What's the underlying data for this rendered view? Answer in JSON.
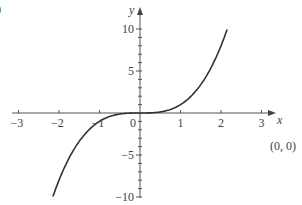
{
  "part_label": ")",
  "annotation": "(0, 0)",
  "chart_data": {
    "type": "line",
    "title": "",
    "function": "y = x^3",
    "xlabel": "x",
    "ylabel": "y",
    "xlim": [
      -3,
      3
    ],
    "ylim": [
      -10,
      10
    ],
    "x_ticks": [
      "-3",
      "-2",
      "-1",
      "0",
      "1",
      "2",
      "3"
    ],
    "y_ticks": [
      "10",
      "5",
      "-5",
      "-10"
    ],
    "grid": false,
    "series": [
      {
        "name": "y = x^3",
        "x": [
          -2.15,
          -2,
          -1.5,
          -1,
          -0.5,
          0,
          0.5,
          1,
          1.5,
          2,
          2.15
        ],
        "y": [
          -9.94,
          -8,
          -3.375,
          -1,
          -0.125,
          0,
          0.125,
          1,
          3.375,
          8,
          9.94
        ]
      }
    ],
    "annotations": [
      {
        "text": "(0, 0)",
        "x": 0,
        "y": 0
      }
    ]
  }
}
